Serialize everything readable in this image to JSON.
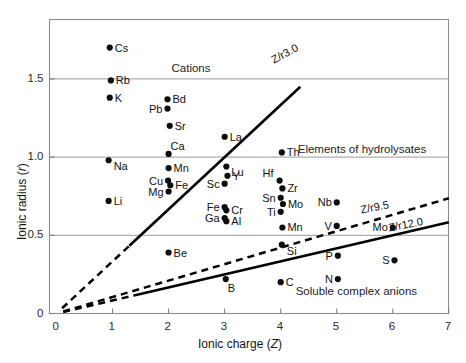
{
  "chart_data": {
    "type": "scatter",
    "title": "",
    "xlabel": "Ionic charge  (Z)",
    "ylabel": "Ionic radius (r)",
    "xlim": [
      0,
      7
    ],
    "ylim": [
      0,
      1.85
    ],
    "grid": true,
    "legend_position": "none",
    "xticks": [
      0,
      1,
      2,
      3,
      4,
      5,
      6,
      7
    ],
    "xtick_labels": [
      "0",
      "1",
      "2",
      "3",
      "4",
      "5",
      "6",
      "7"
    ],
    "yticks": [
      0,
      0.5,
      1.0,
      1.5
    ],
    "ytick_labels": [
      "0",
      "0.5",
      "1.0",
      "1.5"
    ],
    "gridlines_y": [
      0.5,
      1.0,
      1.5
    ],
    "points": [
      {
        "label": "Cs",
        "x": 0.95,
        "y": 1.7,
        "label_side": "right"
      },
      {
        "label": "Rb",
        "x": 0.97,
        "y": 1.49,
        "label_side": "right"
      },
      {
        "label": "K",
        "x": 0.95,
        "y": 1.38,
        "label_side": "right"
      },
      {
        "label": "Bd",
        "x": 1.98,
        "y": 1.37,
        "label_side": "right"
      },
      {
        "label": "Pb",
        "x": 1.98,
        "y": 1.31,
        "label_side": "left"
      },
      {
        "label": "Sr",
        "x": 2.02,
        "y": 1.2,
        "label_side": "right"
      },
      {
        "label": "La",
        "x": 3.0,
        "y": 1.13,
        "label_side": "right"
      },
      {
        "label": "Ca",
        "x": 2.0,
        "y": 1.02,
        "label_side": "above"
      },
      {
        "label": "Th",
        "x": 4.02,
        "y": 1.03,
        "label_side": "right"
      },
      {
        "label": "Na",
        "x": 0.93,
        "y": 0.98,
        "label_side": "right-below"
      },
      {
        "label": "Mn",
        "x": 2.0,
        "y": 0.93,
        "label_side": "right"
      },
      {
        "label": "Lu",
        "x": 3.03,
        "y": 0.94,
        "label_side": "right-below"
      },
      {
        "label": "Y",
        "x": 3.05,
        "y": 0.88,
        "label_side": "right"
      },
      {
        "label": "Cu",
        "x": 1.99,
        "y": 0.85,
        "label_side": "left"
      },
      {
        "label": "Fe",
        "x": 2.03,
        "y": 0.82,
        "label_side": "right"
      },
      {
        "label": "Sc",
        "x": 3.0,
        "y": 0.83,
        "label_side": "left"
      },
      {
        "label": "Hf",
        "x": 3.98,
        "y": 0.85,
        "label_side": "above-left"
      },
      {
        "label": "Zr",
        "x": 4.03,
        "y": 0.8,
        "label_side": "right"
      },
      {
        "label": "Mg",
        "x": 2.0,
        "y": 0.78,
        "label_side": "left"
      },
      {
        "label": "Li",
        "x": 0.93,
        "y": 0.72,
        "label_side": "right"
      },
      {
        "label": "Sn",
        "x": 4.0,
        "y": 0.74,
        "label_side": "left"
      },
      {
        "label": "Mo",
        "x": 4.04,
        "y": 0.7,
        "label_side": "right"
      },
      {
        "label": "Nb",
        "x": 5.0,
        "y": 0.71,
        "label_side": "left"
      },
      {
        "label": "Fe",
        "x": 3.0,
        "y": 0.68,
        "label_side": "left"
      },
      {
        "label": "Cr",
        "x": 3.03,
        "y": 0.66,
        "label_side": "right"
      },
      {
        "label": "Ti",
        "x": 4.0,
        "y": 0.65,
        "label_side": "left"
      },
      {
        "label": "Ga",
        "x": 3.0,
        "y": 0.61,
        "label_side": "left"
      },
      {
        "label": "Al",
        "x": 3.03,
        "y": 0.59,
        "label_side": "right"
      },
      {
        "label": "Mn",
        "x": 4.03,
        "y": 0.55,
        "label_side": "right"
      },
      {
        "label": "V",
        "x": 5.0,
        "y": 0.56,
        "label_side": "left"
      },
      {
        "label": "Mo",
        "x": 6.0,
        "y": 0.55,
        "label_side": "left"
      },
      {
        "label": "Si",
        "x": 4.02,
        "y": 0.44,
        "label_side": "right-below"
      },
      {
        "label": "Be",
        "x": 2.0,
        "y": 0.39,
        "label_side": "right"
      },
      {
        "label": "P",
        "x": 5.02,
        "y": 0.37,
        "label_side": "left"
      },
      {
        "label": "S",
        "x": 6.03,
        "y": 0.34,
        "label_side": "left"
      },
      {
        "label": "B",
        "x": 3.02,
        "y": 0.22,
        "label_side": "below"
      },
      {
        "label": "N",
        "x": 5.02,
        "y": 0.22,
        "label_side": "left"
      },
      {
        "label": "C",
        "x": 4.0,
        "y": 0.2,
        "label_side": "right"
      }
    ],
    "boundary_lines": [
      {
        "name": "Z/r3.0",
        "label": "Z/r3.0",
        "style": "solid",
        "ratio": 3.0,
        "x_start": 1.3,
        "x_end": 4.35,
        "label_x": 4.15,
        "label_y": 1.62,
        "label_rotation": -28
      },
      {
        "name": "Z/r3.0-extension",
        "label": "",
        "style": "dashed",
        "ratio": 3.0,
        "x_start": 0.1,
        "x_end": 1.3,
        "label_x": 0,
        "label_y": 0,
        "label_rotation": 0
      },
      {
        "name": "Z/r9.5",
        "label": "Z/r9.5",
        "style": "dashed",
        "ratio": 9.5,
        "x_start": 0.12,
        "x_end": 7.0,
        "label_x": 5.7,
        "label_y": 0.66,
        "label_rotation": -11
      },
      {
        "name": "Z/r12.0",
        "label": "Z/r12.0",
        "style": "solid",
        "ratio": 12.0,
        "x_start": 1.4,
        "x_end": 7.0,
        "label_x": 6.25,
        "label_y": 0.545,
        "label_rotation": -11
      },
      {
        "name": "Z/r12.0-extension",
        "label": "",
        "style": "dashed",
        "ratio": 12.0,
        "x_start": 0.12,
        "x_end": 1.4,
        "label_x": 0,
        "label_y": 0,
        "label_rotation": 0
      }
    ],
    "region_labels": [
      {
        "name": "cations",
        "text": "Cations",
        "x": 2.4,
        "y": 1.565
      },
      {
        "name": "hydrolysates",
        "text": "Elements of hydrolysates",
        "x": 5.45,
        "y": 1.045
      },
      {
        "name": "soluble-complex-anions",
        "text": "Soluble complex anions",
        "x": 5.35,
        "y": 0.135
      }
    ]
  }
}
